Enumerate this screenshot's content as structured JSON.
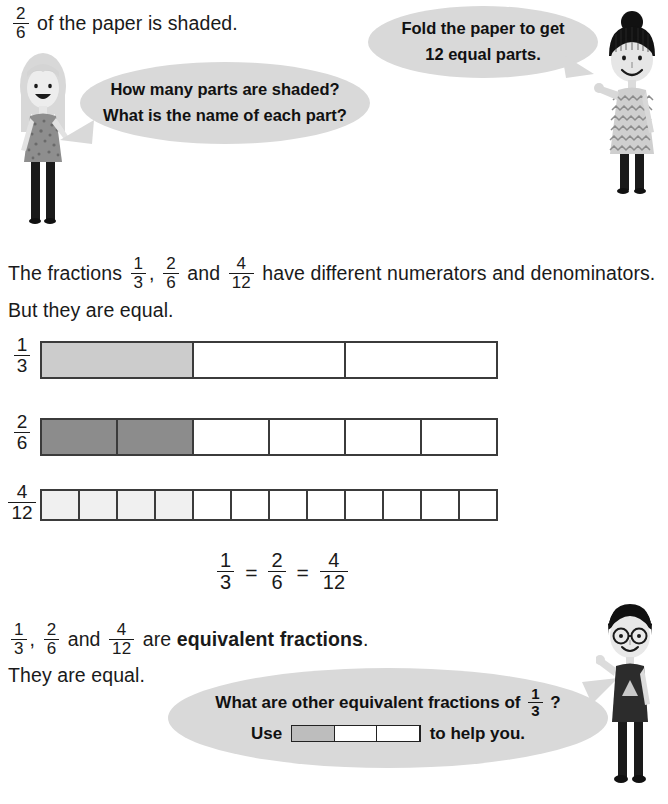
{
  "page": {
    "width": 668,
    "height": 804,
    "background": "#ffffff"
  },
  "intro": {
    "fraction": {
      "numerator": "2",
      "denominator": "6"
    },
    "text": "of the paper is shaded."
  },
  "bubbles": {
    "girl_question": {
      "line1": "How many parts are shaded?",
      "line2": "What is the name of each part?",
      "fill": "#d9d9d9"
    },
    "teacher_instruction": {
      "line1": "Fold the paper to get",
      "line2": "12 equal parts.",
      "fill": "#d9d9d9"
    },
    "boy_question": {
      "line1_before": "What are other equivalent fractions of",
      "line1_fraction": {
        "numerator": "1",
        "denominator": "3"
      },
      "line1_after": "?",
      "line2_before": "Use",
      "line2_after": "to help you.",
      "fill": "#d9d9d9",
      "mini_bar": {
        "parts": 3,
        "shaded": 1,
        "shaded_color": "#bdbdbd"
      }
    }
  },
  "paragraph_1": {
    "part1": "The fractions",
    "frac_a": {
      "numerator": "1",
      "denominator": "3"
    },
    "comma": ",",
    "frac_b": {
      "numerator": "2",
      "denominator": "6"
    },
    "part2": "and",
    "frac_c": {
      "numerator": "4",
      "denominator": "12"
    },
    "part3": "have different numerators and denominators.",
    "line2": "But they are equal."
  },
  "bars": [
    {
      "name": "one-third",
      "label": {
        "numerator": "1",
        "denominator": "3"
      },
      "parts": 3,
      "shaded": 1,
      "shaded_color": "#cccccc"
    },
    {
      "name": "two-sixths",
      "label": {
        "numerator": "2",
        "denominator": "6"
      },
      "parts": 6,
      "shaded": 2,
      "shaded_color": "#8c8c8c"
    },
    {
      "name": "four-twelfths",
      "label": {
        "numerator": "4",
        "denominator": "12"
      },
      "parts": 12,
      "shaded": 4,
      "shaded_color": "#f0f0f0"
    }
  ],
  "equation": {
    "frac_a": {
      "numerator": "1",
      "denominator": "3"
    },
    "sign_1": "=",
    "frac_b": {
      "numerator": "2",
      "denominator": "6"
    },
    "sign_2": "=",
    "frac_c": {
      "numerator": "4",
      "denominator": "12"
    }
  },
  "conclusion": {
    "frac_a": {
      "numerator": "1",
      "denominator": "3"
    },
    "comma": ",",
    "frac_b": {
      "numerator": "2",
      "denominator": "6"
    },
    "and": "and",
    "frac_c": {
      "numerator": "4",
      "denominator": "12"
    },
    "are": "are",
    "term": "equivalent fractions",
    "period": ".",
    "line2": "They are equal."
  },
  "characters": {
    "girl": {
      "name": "girl-blonde-character",
      "hair": "#d4d4d4",
      "dress": "#8a8a8a",
      "legs": "#1a1a1a"
    },
    "teacher": {
      "name": "woman-teacher-character",
      "hair": "#111111",
      "dress": "#c9c9c9",
      "legs": "#1a1a1a"
    },
    "boy": {
      "name": "boy-glasses-character",
      "hair": "#111111",
      "shirt": "#2a2a2a",
      "legs": "#1a1a1a"
    }
  }
}
